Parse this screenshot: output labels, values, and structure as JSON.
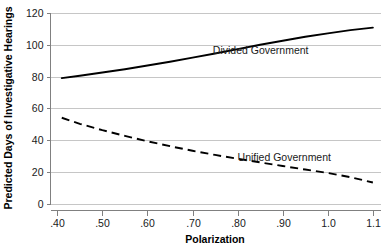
{
  "chart_data": {
    "type": "line",
    "title": "",
    "xlabel": "Polarization",
    "ylabel": "Predicted Days of Investigative Hearings",
    "xlim": [
      0.385,
      1.118
    ],
    "ylim": [
      0,
      120
    ],
    "grid": "horizontal",
    "legend_position": "inline-annotations",
    "xticks": [
      0.4,
      0.5,
      0.6,
      0.7,
      0.8,
      0.9,
      1.0,
      1.1
    ],
    "xticklabels": [
      ".40",
      ".50",
      ".60",
      ".70",
      ".80",
      ".90",
      "1.0",
      "1.1"
    ],
    "yticks": [
      0,
      20,
      40,
      60,
      80,
      100,
      120
    ],
    "yticklabels": [
      "0",
      "20",
      "40",
      "60",
      "80",
      "100",
      "120"
    ],
    "x": [
      0.41,
      0.45,
      0.5,
      0.55,
      0.6,
      0.65,
      0.7,
      0.75,
      0.8,
      0.85,
      0.9,
      0.95,
      1.0,
      1.05,
      1.1
    ],
    "series": [
      {
        "name": "Divided Government",
        "style": "solid",
        "label_x": 0.745,
        "label_y": 94,
        "values": [
          79,
          80.5,
          82.5,
          84.6,
          86.9,
          89.3,
          91.9,
          94.5,
          97.2,
          100.0,
          102.5,
          105.0,
          107.2,
          109.2,
          110.8
        ]
      },
      {
        "name": "Unified Government",
        "style": "dashed",
        "label_x": 0.8,
        "label_y": 27,
        "values": [
          54,
          50.2,
          46.2,
          42.6,
          39.2,
          36.1,
          33.2,
          30.6,
          28.2,
          25.9,
          23.6,
          21.4,
          19.2,
          16.6,
          13.2
        ]
      }
    ],
    "annotations": [
      {
        "text": "Divided Government"
      },
      {
        "text": "Unified Government"
      }
    ]
  },
  "colors": {
    "line": "#000000",
    "grid": "#b8b8b8",
    "axis": "#808080",
    "background": "#ffffff",
    "text": "#1a1a1a"
  }
}
